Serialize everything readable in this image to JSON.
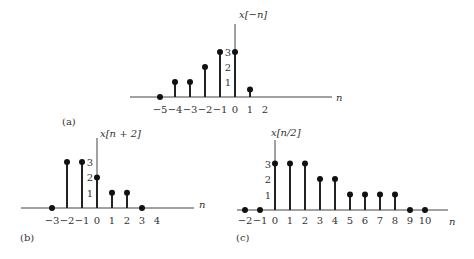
{
  "chart_data": [
    {
      "type": "stem",
      "panel": "(a)",
      "title": "x[−n]",
      "xlabel": "n",
      "x": [
        -5,
        -4,
        -3,
        -2,
        -1,
        0,
        1
      ],
      "values": [
        0,
        1,
        1,
        2,
        3,
        3,
        0.5
      ],
      "tick_labels": [
        "−5",
        "−4",
        "−3",
        "−2",
        "−1",
        "0",
        "1",
        "2"
      ],
      "tick_positions": [
        -5,
        -4,
        -3,
        -2,
        -1,
        0,
        1,
        2
      ],
      "y_tick_labels": [
        "1",
        "2",
        "3"
      ],
      "layout": {
        "x0": 235,
        "y0": 97,
        "unit_x": 15,
        "unit_y": 15,
        "axis_left": 130,
        "axis_right": 332,
        "axis_top": 24,
        "title_x": 239,
        "title_y": 18,
        "panel_x": 62,
        "panel_y": 125,
        "label_y": 113,
        "n_x": 336,
        "n_y": 101
      }
    },
    {
      "type": "stem",
      "panel": "(b)",
      "title": "x[n + 2]",
      "xlabel": "n",
      "x": [
        -3,
        -2,
        -1,
        0,
        1,
        2,
        3
      ],
      "values": [
        0,
        3,
        3,
        2,
        1,
        1,
        0
      ],
      "tick_labels": [
        "−3",
        "−2",
        "−1",
        "0",
        "1",
        "2",
        "3",
        "4"
      ],
      "tick_positions": [
        -3,
        -2,
        -1,
        0,
        1,
        2,
        3,
        4
      ],
      "y_tick_labels": [
        "1",
        "2",
        "3"
      ],
      "layout": {
        "x0": 97,
        "y0": 208,
        "unit_x": 15,
        "unit_y": 15.3,
        "axis_left": 21,
        "axis_right": 194,
        "axis_top": 138,
        "title_x": 100,
        "title_y": 137,
        "panel_x": 20,
        "panel_y": 241,
        "label_y": 224,
        "n_x": 199,
        "n_y": 208
      }
    },
    {
      "type": "stem",
      "panel": "(c)",
      "title": "x[n/2]",
      "xlabel": "n",
      "x": [
        -2,
        -1,
        0,
        1,
        2,
        3,
        4,
        5,
        6,
        7,
        8,
        9,
        10
      ],
      "values": [
        0,
        0,
        3,
        3,
        3,
        2,
        2,
        1,
        1,
        1,
        1,
        0,
        0
      ],
      "tick_labels": [
        "−2",
        "−1",
        "0",
        "1",
        "2",
        "3",
        "4",
        "5",
        "6",
        "7",
        "8",
        "9",
        "10"
      ],
      "tick_positions": [
        -2,
        -1,
        0,
        1,
        2,
        3,
        4,
        5,
        6,
        7,
        8,
        9,
        10
      ],
      "y_tick_labels": [
        "1",
        "2",
        "3"
      ],
      "layout": {
        "x0": 275,
        "y0": 210,
        "unit_x": 15,
        "unit_y": 15.5,
        "axis_left": 237,
        "axis_right": 448,
        "axis_top": 140,
        "title_x": 271,
        "title_y": 136,
        "panel_x": 236,
        "panel_y": 241,
        "label_y": 224,
        "n_x": 449,
        "n_y": 225
      }
    }
  ]
}
